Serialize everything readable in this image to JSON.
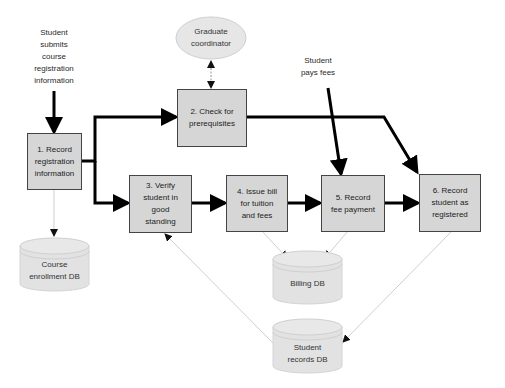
{
  "external_labels": {
    "student_submits": "Student\nsubmits\ncourse\nregistration\ninformation",
    "student_pays": "Student\npays fees"
  },
  "actor": {
    "graduate_coordinator": "Graduate\ncoordinator"
  },
  "processes": [
    {
      "id": 1,
      "label": "1. Record\nregistration\ninformation"
    },
    {
      "id": 2,
      "label": "2. Check for\nprerequisites"
    },
    {
      "id": 3,
      "label": "3. Verify\nstudent in\ngood\nstanding"
    },
    {
      "id": 4,
      "label": "4. Issue bill\nfor tuition\nand fees"
    },
    {
      "id": 5,
      "label": "5. Record\nfee payment"
    },
    {
      "id": 6,
      "label": "6. Record\nstudent as\nregistered"
    }
  ],
  "data_stores": {
    "course_enrollment": "Course\nenrollment DB",
    "billing": "Billing DB",
    "student_records": "Student\nrecords DB"
  },
  "colors": {
    "box_fill": "#d6d6d6",
    "box_border": "#444444",
    "db_fill": "#e2e2e2",
    "ellipse_fill": "#e6e6e6",
    "flow_line": "#000000",
    "data_line": "#cfcfcf"
  }
}
